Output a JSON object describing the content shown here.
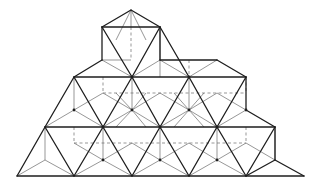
{
  "diagram": {
    "colors": {
      "background": "#ffffff",
      "heavy_edge": "#1e1e1e",
      "light_edge": "#6a6a6a"
    },
    "heavy_edges": [
      [
        131,
        10,
        102,
        27
      ],
      [
        131,
        10,
        160,
        27
      ],
      [
        102,
        27,
        160,
        27
      ],
      [
        102,
        27,
        102,
        60
      ],
      [
        160,
        27,
        160,
        60
      ],
      [
        102,
        27,
        132,
        77
      ],
      [
        160,
        27,
        132,
        77
      ],
      [
        160,
        27,
        189,
        77
      ],
      [
        102,
        60,
        74,
        77
      ],
      [
        160,
        60,
        217,
        60
      ],
      [
        217,
        60,
        246,
        77
      ],
      [
        246,
        77,
        246,
        110
      ],
      [
        74,
        77,
        246,
        77
      ],
      [
        74,
        77,
        45,
        127
      ],
      [
        74,
        77,
        103,
        127
      ],
      [
        132,
        77,
        103,
        127
      ],
      [
        132,
        77,
        160,
        127
      ],
      [
        189,
        77,
        160,
        127
      ],
      [
        189,
        77,
        217,
        127
      ],
      [
        246,
        77,
        217,
        127
      ],
      [
        246,
        110,
        275,
        127
      ],
      [
        275,
        127,
        275,
        160
      ],
      [
        45,
        127,
        275,
        127
      ],
      [
        45,
        127,
        17,
        176
      ],
      [
        45,
        127,
        74,
        176
      ],
      [
        103,
        127,
        74,
        176
      ],
      [
        103,
        127,
        132,
        176
      ],
      [
        160,
        127,
        132,
        176
      ],
      [
        160,
        127,
        189,
        176
      ],
      [
        217,
        127,
        189,
        176
      ],
      [
        217,
        127,
        246,
        176
      ],
      [
        275,
        127,
        246,
        176
      ],
      [
        275,
        160,
        246,
        176
      ],
      [
        275,
        160,
        304,
        176
      ],
      [
        17,
        176,
        304,
        176
      ]
    ],
    "light_edges": [
      [
        131,
        10,
        131,
        27
      ],
      [
        131,
        10,
        116,
        40
      ],
      [
        131,
        10,
        146,
        40
      ],
      [
        102,
        60,
        132,
        77
      ],
      [
        160,
        60,
        132,
        77
      ],
      [
        160,
        60,
        189,
        77
      ],
      [
        217,
        60,
        189,
        77
      ],
      [
        102,
        60,
        131,
        60
      ],
      [
        160,
        27,
        160,
        77
      ],
      [
        74,
        110,
        74,
        77
      ],
      [
        74,
        110,
        45,
        127
      ],
      [
        74,
        110,
        103,
        127
      ],
      [
        74,
        110,
        103,
        93
      ],
      [
        132,
        110,
        103,
        93
      ],
      [
        132,
        110,
        160,
        93
      ],
      [
        132,
        110,
        132,
        77
      ],
      [
        132,
        110,
        103,
        127
      ],
      [
        132,
        110,
        160,
        127
      ],
      [
        132,
        110,
        116,
        93
      ],
      [
        132,
        110,
        146,
        93
      ],
      [
        132,
        110,
        116,
        127
      ],
      [
        132,
        110,
        146,
        127
      ],
      [
        189,
        110,
        160,
        93
      ],
      [
        189,
        110,
        217,
        93
      ],
      [
        189,
        110,
        189,
        77
      ],
      [
        189,
        110,
        160,
        127
      ],
      [
        189,
        110,
        217,
        127
      ],
      [
        189,
        110,
        174,
        93
      ],
      [
        189,
        110,
        204,
        93
      ],
      [
        189,
        110,
        174,
        127
      ],
      [
        189,
        110,
        204,
        127
      ],
      [
        246,
        110,
        217,
        93
      ],
      [
        246,
        110,
        217,
        127
      ],
      [
        45,
        160,
        17,
        176
      ],
      [
        45,
        160,
        74,
        176
      ],
      [
        45,
        160,
        45,
        127
      ],
      [
        103,
        160,
        74,
        176
      ],
      [
        103,
        160,
        132,
        176
      ],
      [
        103,
        160,
        103,
        127
      ],
      [
        103,
        160,
        74,
        143
      ],
      [
        103,
        160,
        132,
        143
      ],
      [
        160,
        160,
        132,
        176
      ],
      [
        160,
        160,
        189,
        176
      ],
      [
        160,
        160,
        160,
        127
      ],
      [
        160,
        160,
        132,
        143
      ],
      [
        160,
        160,
        189,
        143
      ],
      [
        217,
        160,
        189,
        176
      ],
      [
        217,
        160,
        246,
        176
      ],
      [
        217,
        160,
        217,
        127
      ],
      [
        217,
        160,
        189,
        143
      ],
      [
        217,
        160,
        246,
        143
      ],
      [
        275,
        160,
        275,
        127
      ],
      [
        246,
        143,
        275,
        160
      ]
    ],
    "dashed_edges": [
      [
        103,
        93,
        246,
        93
      ],
      [
        74,
        143,
        246,
        143
      ],
      [
        131,
        27,
        131,
        60
      ],
      [
        189,
        60,
        189,
        77
      ],
      [
        74,
        127,
        74,
        143
      ],
      [
        246,
        127,
        246,
        143
      ],
      [
        103,
        77,
        103,
        93
      ],
      [
        246,
        77,
        246,
        93
      ]
    ],
    "nodes": [
      [
        132,
        77
      ],
      [
        189,
        77
      ],
      [
        74,
        110
      ],
      [
        132,
        110
      ],
      [
        189,
        110
      ],
      [
        246,
        110
      ],
      [
        103,
        127
      ],
      [
        160,
        127
      ],
      [
        217,
        127
      ],
      [
        103,
        160
      ],
      [
        160,
        160
      ],
      [
        217,
        160
      ]
    ]
  }
}
